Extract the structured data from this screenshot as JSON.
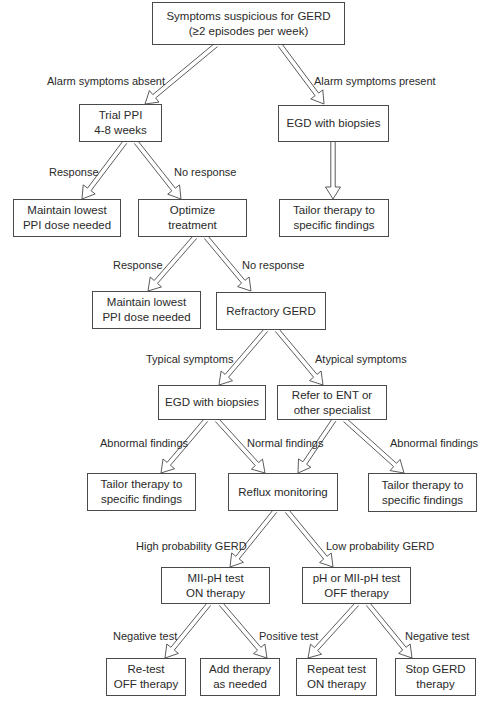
{
  "diagram": {
    "type": "flowchart",
    "topic": "GERD management algorithm",
    "nodes": [
      {
        "id": "start",
        "lines": [
          "Symptoms suspicious for GERD",
          "(≥2 episodes per week)"
        ],
        "box": [
          152,
          2,
          193,
          43
        ]
      },
      {
        "id": "trial_ppi",
        "lines": [
          "Trial PPI",
          "4-8 weeks"
        ],
        "box": [
          79,
          104,
          83,
          38
        ]
      },
      {
        "id": "egd1",
        "lines": [
          "EGD with biopsies"
        ],
        "box": [
          278,
          105,
          111,
          37
        ]
      },
      {
        "id": "maintain1",
        "lines": [
          "Maintain lowest",
          "PPI dose needed"
        ],
        "box": [
          13,
          199,
          108,
          38
        ]
      },
      {
        "id": "optimize",
        "lines": [
          "Optimize",
          "treatment"
        ],
        "box": [
          138,
          199,
          109,
          38
        ]
      },
      {
        "id": "tailor1",
        "lines": [
          "Tailor therapy to",
          "specific findings"
        ],
        "box": [
          279,
          199,
          110,
          38
        ]
      },
      {
        "id": "maintain2",
        "lines": [
          "Maintain lowest",
          "PPI dose needed"
        ],
        "box": [
          92,
          291,
          109,
          38
        ]
      },
      {
        "id": "refractory",
        "lines": [
          "Refractory GERD"
        ],
        "box": [
          216,
          292,
          110,
          38
        ]
      },
      {
        "id": "egd2",
        "lines": [
          "EGD with biopsies"
        ],
        "box": [
          158,
          385,
          108,
          35
        ]
      },
      {
        "id": "refer_ent",
        "lines": [
          "Refer to ENT or",
          "other specialist"
        ],
        "box": [
          277,
          385,
          110,
          35
        ]
      },
      {
        "id": "tailor2",
        "lines": [
          "Tailor therapy to",
          "specific findings"
        ],
        "box": [
          87,
          473,
          109,
          38
        ]
      },
      {
        "id": "reflux",
        "lines": [
          "Reflux monitoring"
        ],
        "box": [
          228,
          473,
          110,
          38
        ]
      },
      {
        "id": "tailor3",
        "lines": [
          "Tailor therapy to",
          "specific findings"
        ],
        "box": [
          368,
          473,
          109,
          39
        ]
      },
      {
        "id": "mii_on",
        "lines": [
          "MII-pH test",
          "ON therapy"
        ],
        "box": [
          161,
          567,
          109,
          37
        ]
      },
      {
        "id": "ph_off",
        "lines": [
          "pH or MII-pH test",
          "OFF therapy"
        ],
        "box": [
          302,
          567,
          109,
          37
        ]
      },
      {
        "id": "retest",
        "lines": [
          "Re-test",
          "OFF therapy"
        ],
        "box": [
          106,
          658,
          80,
          38
        ]
      },
      {
        "id": "add_therapy",
        "lines": [
          "Add therapy",
          "as needed"
        ],
        "box": [
          200,
          658,
          80,
          38
        ]
      },
      {
        "id": "repeat_test",
        "lines": [
          "Repeat test",
          "ON therapy"
        ],
        "box": [
          296,
          658,
          81,
          38
        ]
      },
      {
        "id": "stop_gerd",
        "lines": [
          "Stop GERD",
          "therapy"
        ],
        "box": [
          395,
          658,
          81,
          38
        ]
      }
    ],
    "edges": [
      {
        "from": "start",
        "to": "trial_ppi",
        "label": "Alarm symptoms absent",
        "path": [
          [
            216,
            45
          ],
          [
            145,
            104
          ]
        ],
        "label_pos": [
          47,
          75
        ]
      },
      {
        "from": "start",
        "to": "egd1",
        "label": "Alarm symptoms present",
        "path": [
          [
            280,
            45
          ],
          [
            324,
            104
          ]
        ],
        "label_pos": [
          314,
          75
        ]
      },
      {
        "from": "trial_ppi",
        "to": "maintain1",
        "label": "Response",
        "path": [
          [
            125,
            142
          ],
          [
            82,
            199
          ]
        ],
        "label_pos": [
          49,
          166
        ]
      },
      {
        "from": "trial_ppi",
        "to": "optimize",
        "label": "No response",
        "path": [
          [
            136,
            142
          ],
          [
            181,
            199
          ]
        ],
        "label_pos": [
          174,
          166
        ]
      },
      {
        "from": "egd1",
        "to": "tailor1",
        "label": "",
        "path": [
          [
            333,
            142
          ],
          [
            333,
            199
          ]
        ],
        "label_pos": null
      },
      {
        "from": "optimize",
        "to": "maintain2",
        "label": "Response",
        "path": [
          [
            195,
            237
          ],
          [
            148,
            291
          ]
        ],
        "label_pos": [
          113,
          259
        ]
      },
      {
        "from": "optimize",
        "to": "refractory",
        "label": "No response",
        "path": [
          [
            206,
            237
          ],
          [
            251,
            291
          ]
        ],
        "label_pos": [
          242,
          259
        ]
      },
      {
        "from": "refractory",
        "to": "egd2",
        "label": "Typical symptoms",
        "path": [
          [
            266,
            330
          ],
          [
            219,
            385
          ]
        ],
        "label_pos": [
          146,
          353
        ]
      },
      {
        "from": "refractory",
        "to": "refer_ent",
        "label": "Atypical symptoms",
        "path": [
          [
            277,
            330
          ],
          [
            323,
            385
          ]
        ],
        "label_pos": [
          315,
          353
        ]
      },
      {
        "from": "egd2",
        "to": "tailor2",
        "label": "Abnormal findings",
        "path": [
          [
            206,
            420
          ],
          [
            161,
            473
          ]
        ],
        "label_pos": [
          100,
          437
        ]
      },
      {
        "from": "egd2",
        "to": "reflux",
        "label": "Normal findings",
        "path": [
          [
            217,
            420
          ],
          [
            265,
            473
          ]
        ],
        "label_pos": [
          247,
          437
        ]
      },
      {
        "from": "refer_ent",
        "to": "reflux",
        "label": "",
        "path": [
          [
            334,
            420
          ],
          [
            298,
            473
          ]
        ],
        "label_pos": null
      },
      {
        "from": "refer_ent",
        "to": "tailor3",
        "label": "Abnormal findings",
        "path": [
          [
            345,
            420
          ],
          [
            404,
            473
          ]
        ],
        "label_pos": [
          390,
          437
        ]
      },
      {
        "from": "reflux",
        "to": "mii_on",
        "label": "High probability GERD",
        "path": [
          [
            275,
            511
          ],
          [
            230,
            567
          ]
        ],
        "label_pos": [
          136,
          540
        ]
      },
      {
        "from": "reflux",
        "to": "ph_off",
        "label": "Low probability GERD",
        "path": [
          [
            287,
            511
          ],
          [
            333,
            567
          ]
        ],
        "label_pos": [
          326,
          540
        ]
      },
      {
        "from": "mii_on",
        "to": "retest",
        "label": "Negative test",
        "path": [
          [
            209,
            604
          ],
          [
            165,
            658
          ]
        ],
        "label_pos": [
          113,
          630
        ]
      },
      {
        "from": "mii_on",
        "to": "add_therapy",
        "label": "Positive test",
        "path": [
          [
            221,
            604
          ],
          [
            267,
            658
          ]
        ],
        "label_pos": [
          259,
          630
        ]
      },
      {
        "from": "ph_off",
        "to": "repeat_test",
        "label": "",
        "path": [
          [
            357,
            604
          ],
          [
            308,
            658
          ]
        ],
        "label_pos": null
      },
      {
        "from": "ph_off",
        "to": "stop_gerd",
        "label": "Negative test",
        "path": [
          [
            368,
            604
          ],
          [
            412,
            658
          ]
        ],
        "label_pos": [
          405,
          630
        ]
      }
    ]
  },
  "colors": {
    "line": "#4a4a4a",
    "text": "#2a2a2a",
    "background": "#ffffff"
  }
}
